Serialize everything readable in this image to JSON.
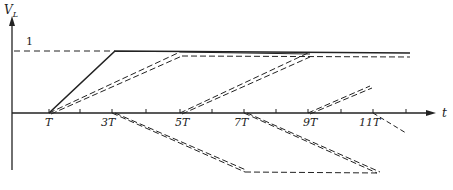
{
  "diagram": {
    "y_axis_label": "V",
    "y_axis_subscript": "L",
    "x_axis_label": "t",
    "level_label": "1",
    "tick_labels": [
      "T",
      "3T",
      "5T",
      "7T",
      "9T",
      "11T"
    ],
    "colors": {
      "ink": "#222222",
      "background": "#ffffff"
    }
  }
}
